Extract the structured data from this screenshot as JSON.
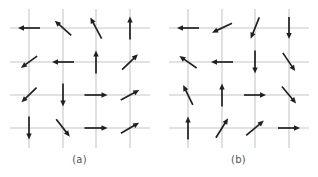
{
  "figure": {
    "background_color": "#ffffff",
    "grid_color": "#c6c6c6",
    "arrow_color": "#231f20",
    "caption_color": "#555555",
    "panel_count": 2
  },
  "panels": [
    {
      "id": "a",
      "caption": "(a)",
      "grid": {
        "rows": 4,
        "cols": 4,
        "x_positions": [
          29,
          63,
          96,
          130
        ],
        "y_positions": [
          28,
          62,
          95,
          128
        ],
        "h_line_x_start": 10,
        "h_line_x_end": 150,
        "v_line_y_start": 9,
        "v_line_y_end": 148
      },
      "chart_data": {
        "type": "vector-field",
        "title": "(a)",
        "description": "4 by 4 square lattice of spin vectors",
        "angles_deg": [
          [
            180,
            138,
            118,
            90
          ],
          [
            216,
            180,
            90,
            44
          ],
          [
            224,
            270,
            0,
            28
          ],
          [
            270,
            -52,
            0,
            30
          ]
        ],
        "lengths": [
          [
            22,
            22,
            24,
            23
          ],
          [
            20,
            22,
            23,
            22
          ],
          [
            21,
            23,
            23,
            21
          ],
          [
            23,
            22,
            23,
            21
          ]
        ]
      }
    },
    {
      "id": "b",
      "caption": "(b)",
      "grid": {
        "rows": 4,
        "cols": 4,
        "x_positions": [
          29,
          63,
          96,
          130
        ],
        "y_positions": [
          28,
          62,
          95,
          128
        ],
        "h_line_x_start": 10,
        "h_line_x_end": 150,
        "v_line_y_start": 9,
        "v_line_y_end": 148
      },
      "chart_data": {
        "type": "vector-field",
        "title": "(b)",
        "description": "4 by 4 square lattice of spin vectors",
        "angles_deg": [
          [
            180,
            205,
            248,
            270
          ],
          [
            145,
            180,
            270,
            -56
          ],
          [
            116,
            90,
            0,
            -50
          ],
          [
            90,
            58,
            40,
            0
          ]
        ],
        "lengths": [
          [
            22,
            22,
            23,
            22
          ],
          [
            21,
            22,
            23,
            22
          ],
          [
            22,
            23,
            22,
            22
          ],
          [
            23,
            23,
            23,
            22
          ]
        ]
      }
    }
  ]
}
